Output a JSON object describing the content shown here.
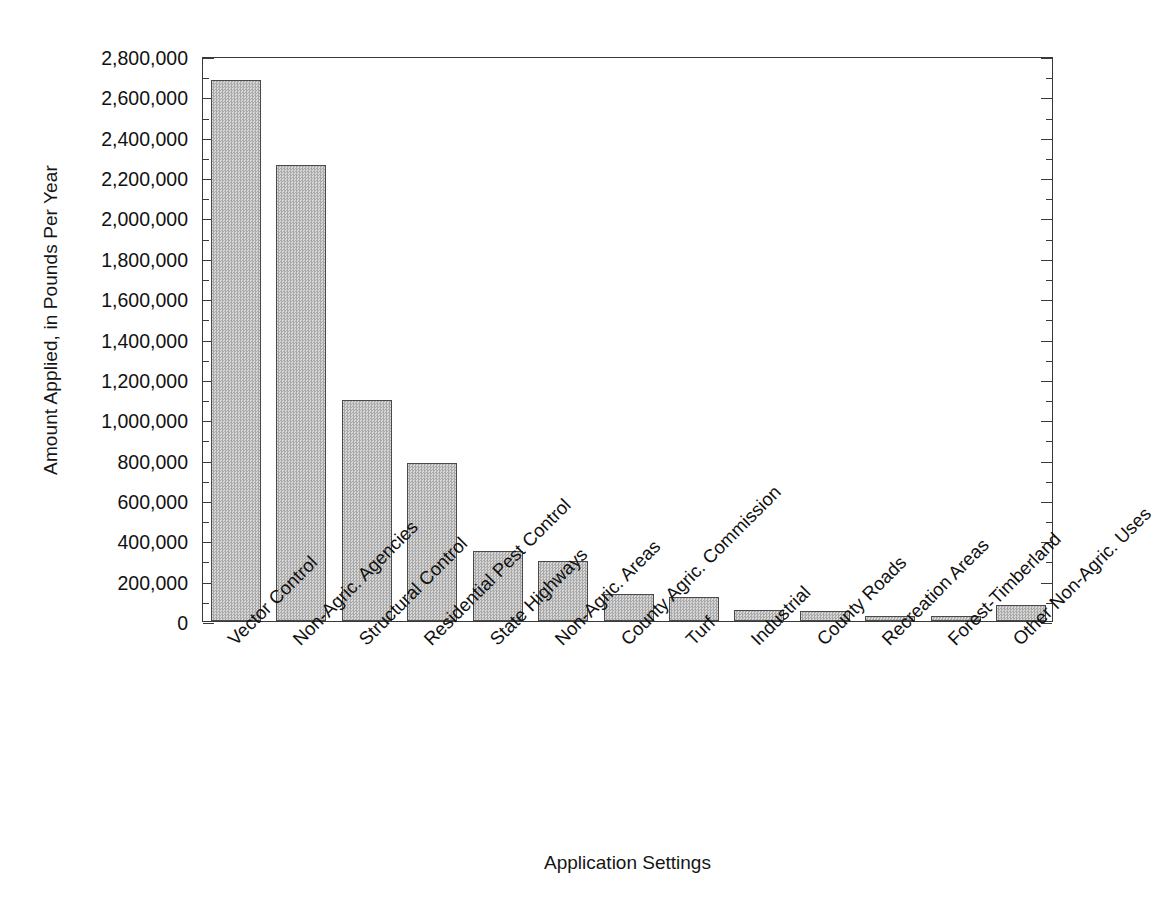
{
  "chart_data": {
    "type": "bar",
    "title": "",
    "xlabel": "Application Settings",
    "ylabel": "Amount Applied, in Pounds Per Year",
    "ylim": [
      0,
      2800000
    ],
    "ytick_step": 200000,
    "yminor_step": 100000,
    "grid": false,
    "legend": "none",
    "bar_fill": "#bdbdbd",
    "bar_edge": "#4a4a4a",
    "axis_color": "#3a3a3a",
    "categories": [
      "Vector Control",
      "Non-Agric. Agencies",
      "Structural Control",
      "Residential Pest Control",
      "State Highways",
      "Non-Agric. Areas",
      "County Agric. Commission",
      "Turf",
      "Industrial",
      "County Roads",
      "Recreation Areas",
      "Forest-Timberland",
      "Other Non-Agric. Uses"
    ],
    "values": [
      2680000,
      2262000,
      1095000,
      782000,
      345000,
      296000,
      132000,
      118000,
      55000,
      52000,
      27000,
      25000,
      80000
    ],
    "ytick_labels": [
      "2,800,000",
      "2,600,000",
      "2,400,000",
      "2,200,000",
      "2,000,000",
      "1,800,000",
      "1,600,000",
      "1,400,000",
      "1,200,000",
      "1,000,000",
      "800,000",
      "600,000",
      "400,000",
      "200,000",
      "0"
    ],
    "ytick_values": [
      2800000,
      2600000,
      2400000,
      2200000,
      2000000,
      1800000,
      1600000,
      1400000,
      1200000,
      1000000,
      800000,
      600000,
      400000,
      200000,
      0
    ]
  }
}
